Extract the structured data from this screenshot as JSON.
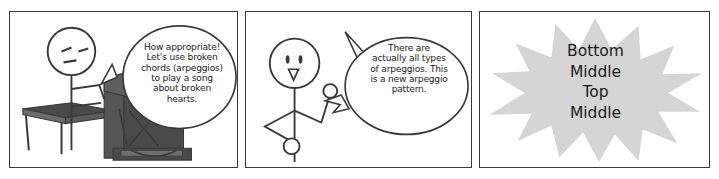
{
  "comic": {
    "title": "Arpeggio comic strip",
    "panel_count": 3,
    "colors": {
      "ink": "#3a3a3a",
      "text": "#1c1c1c",
      "paper": "#ffffff",
      "piano_dark": "#4a4a4a",
      "piano_mid": "#6b6b6b",
      "starburst_gray": "#d5d5d5"
    }
  },
  "panels": [
    {
      "id": "panel-1",
      "name": "piano-player-panel",
      "scene": "stick figure seated at an upright piano with a bench",
      "speech": {
        "speaker": "piano-player",
        "shape": "oval-speech-bubble",
        "text": "How appropriate!\nLet's use broken\nchords (arpeggios)\nto play a song\nabout broken\nhearts."
      }
    },
    {
      "id": "panel-2",
      "name": "standing-figure-panel",
      "scene": "stick figure standing with arms bent, gesturing",
      "speech": {
        "speaker": "standing-figure",
        "shape": "jagged-tail-speech-bubble",
        "text": "There are\nactually all types\nof arpeggios. This\nis a new arpeggio\npattern."
      }
    },
    {
      "id": "panel-3",
      "name": "starburst-panel",
      "scene": "gray starburst burst shape containing stacked words",
      "starburst": {
        "shape": "starburst",
        "fill": "#d5d5d5",
        "text": "Bottom\nMiddle\nTop\nMiddle",
        "lines": [
          "Bottom",
          "Middle",
          "Top",
          "Middle"
        ]
      }
    }
  ]
}
